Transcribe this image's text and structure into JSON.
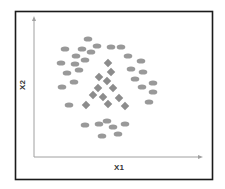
{
  "chart_data": {
    "type": "scatter",
    "title": "",
    "xlabel": "X1",
    "ylabel": "X2",
    "grid": false,
    "legend": null,
    "axis_ticks": false,
    "note": "Coordinates are in pixel space of the plot frame (no numeric ticks shown).",
    "series": [
      {
        "name": "class-circle",
        "marker": "ellipse",
        "color": "#999999",
        "points": [
          [
            88,
            39
          ],
          [
            65,
            49
          ],
          [
            82,
            49
          ],
          [
            97,
            46
          ],
          [
            91,
            52
          ],
          [
            111,
            47
          ],
          [
            121,
            47
          ],
          [
            76,
            56
          ],
          [
            85,
            60
          ],
          [
            61,
            63
          ],
          [
            75,
            64
          ],
          [
            128,
            56
          ],
          [
            141,
            61
          ],
          [
            79,
            70
          ],
          [
            67,
            73
          ],
          [
            131,
            69
          ],
          [
            143,
            72
          ],
          [
            74,
            82
          ],
          [
            62,
            87
          ],
          [
            135,
            79
          ],
          [
            153,
            83
          ],
          [
            142,
            87
          ],
          [
            153,
            92
          ],
          [
            69,
            105
          ],
          [
            149,
            102
          ],
          [
            85,
            125
          ],
          [
            99,
            124
          ],
          [
            107,
            121
          ],
          [
            113,
            127
          ],
          [
            125,
            124
          ],
          [
            102,
            136
          ],
          [
            118,
            134
          ]
        ]
      },
      {
        "name": "class-diamond",
        "marker": "diamond",
        "color": "#8c8c8c",
        "points": [
          [
            108,
            63
          ],
          [
            111,
            72
          ],
          [
            99,
            77
          ],
          [
            107,
            81
          ],
          [
            98,
            88
          ],
          [
            113,
            88
          ],
          [
            93,
            95
          ],
          [
            103,
            97
          ],
          [
            119,
            98
          ],
          [
            86,
            105
          ],
          [
            108,
            104
          ],
          [
            125,
            106
          ]
        ]
      }
    ]
  },
  "labels": {
    "x_axis": "X1",
    "y_axis": "X2"
  },
  "colors": {
    "frame": "#1a1a1a",
    "axis": "#999999",
    "circle": "#999999",
    "diamond": "#8c8c8c"
  }
}
